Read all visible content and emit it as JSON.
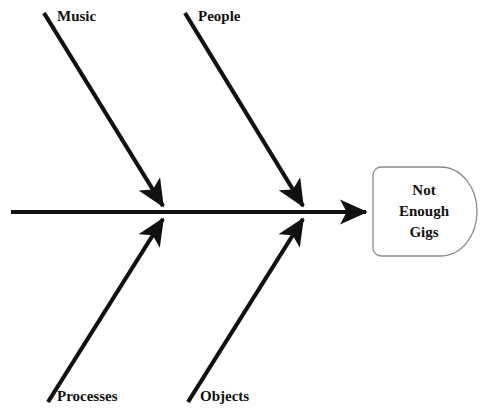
{
  "diagram": {
    "type": "fishbone-ishikawa-cause-and-effect",
    "stroke_color": "#111111",
    "box_stroke_color": "#888888",
    "background_color": "#ffffff",
    "effect": {
      "line1": "Not",
      "line2": "Enough",
      "line3": "Gigs",
      "full_text": "Not Enough Gigs"
    },
    "categories": [
      {
        "label": "Music",
        "position": "top-left"
      },
      {
        "label": "People",
        "position": "top-right"
      },
      {
        "label": "Processes",
        "position": "bottom-left"
      },
      {
        "label": "Objects",
        "position": "bottom-right"
      }
    ]
  }
}
